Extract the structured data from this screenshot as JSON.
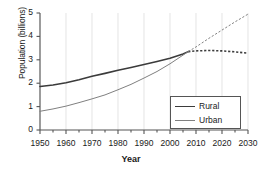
{
  "chart_data": {
    "type": "line",
    "title": "",
    "xlabel": "Year",
    "ylabel": "Population (billions)",
    "xlim": [
      1950,
      2030
    ],
    "ylim": [
      0,
      5
    ],
    "xticks": [
      1950,
      1960,
      1970,
      1980,
      1990,
      2000,
      2010,
      2020,
      2030
    ],
    "xtick_labels": [
      "1950",
      "1960",
      "1970",
      "1980",
      "1990",
      "2000",
      "2010",
      "2020",
      "2030"
    ],
    "xminor_step": 5,
    "yticks": [
      0,
      1,
      2,
      3,
      4,
      5
    ],
    "ytick_labels": [
      "0",
      "1",
      "2",
      "3",
      "4",
      "5"
    ],
    "grid": "vertical-only",
    "grid_color": "#d8d8d8",
    "legend_position": "lower-right",
    "projection_start_year": 2007,
    "series": [
      {
        "name": "Rural",
        "color": "#3b3b3b",
        "width": 1.6,
        "x": [
          1950,
          1955,
          1960,
          1965,
          1970,
          1975,
          1980,
          1985,
          1990,
          1995,
          2000,
          2005,
          2007,
          2010,
          2015,
          2020,
          2025,
          2030
        ],
        "values": [
          1.86,
          1.92,
          2.02,
          2.15,
          2.3,
          2.42,
          2.55,
          2.67,
          2.8,
          2.93,
          3.07,
          3.25,
          3.35,
          3.38,
          3.4,
          3.38,
          3.34,
          3.28
        ],
        "solid_through": 2007,
        "dashed_from": 2007
      },
      {
        "name": "Urban",
        "color": "#808080",
        "width": 1.0,
        "x": [
          1950,
          1955,
          1960,
          1965,
          1970,
          1975,
          1980,
          1985,
          1990,
          1995,
          2000,
          2005,
          2007,
          2010,
          2015,
          2020,
          2025,
          2030
        ],
        "values": [
          0.8,
          0.9,
          1.02,
          1.17,
          1.33,
          1.5,
          1.72,
          1.95,
          2.22,
          2.5,
          2.83,
          3.2,
          3.35,
          3.55,
          3.92,
          4.27,
          4.62,
          4.95
        ],
        "solid_through": 2007,
        "dashed_from": 2007
      }
    ]
  },
  "legend": {
    "items": [
      {
        "label": "Rural"
      },
      {
        "label": "Urban"
      }
    ]
  }
}
